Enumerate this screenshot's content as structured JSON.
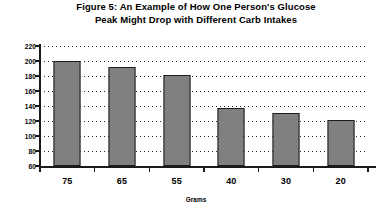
{
  "chart_data": {
    "type": "bar",
    "title": "Figure 5: An Example of How One Person's Glucose Peak Might Drop with Different Carb Intakes",
    "title_lines": [
      "Figure 5: An Example of How One Person's Glucose",
      "Peak Might Drop with Different Carb Intakes"
    ],
    "categories": [
      "75",
      "65",
      "55",
      "40",
      "30",
      "20"
    ],
    "values": [
      200,
      192,
      181,
      138,
      131,
      122
    ],
    "series": [
      {
        "name": "Blood Sugar Peak",
        "values": [
          200,
          192,
          181,
          138,
          131,
          122
        ]
      }
    ],
    "xlabel": "Grams",
    "ylabel": "Blood Sugar Peak (mg/dl)",
    "ylim": [
      60,
      220
    ],
    "ytick_step": 20,
    "yticks": [
      "220",
      "200",
      "180",
      "160",
      "140",
      "120",
      "100",
      "80",
      "60"
    ],
    "grid": true,
    "grid_style": "dotted",
    "legend": false,
    "bar_color": "#808080",
    "bar_border_color": "#1c1c1c",
    "axis_color": "#1a1a1a",
    "background_color": "#ffffff"
  }
}
